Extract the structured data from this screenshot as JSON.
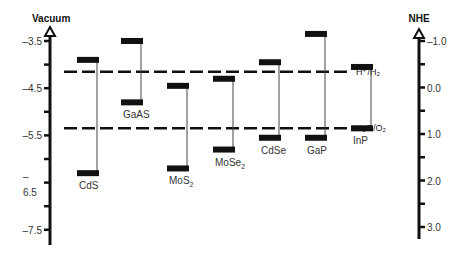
{
  "chart_data": {
    "type": "diagram-bar",
    "title": "",
    "left_axis": {
      "label": "Vacuum",
      "ticks": [
        -3.5,
        -4.5,
        -5.5,
        -6.5,
        -7.5
      ],
      "tick_labels": [
        "-3.5",
        "-4.5",
        "-5.5",
        "6.5",
        "-7.5"
      ],
      "range": [
        -3.5,
        -7.5
      ],
      "unit": "eV"
    },
    "right_axis": {
      "label": "NHE",
      "ticks": [
        -1.0,
        0.0,
        1.0,
        2.0,
        3.0
      ],
      "tick_labels": [
        "-1.0",
        "0.0",
        "1.0",
        "2.0",
        "3.0"
      ],
      "range": [
        -1.0,
        3.0
      ],
      "unit": "V"
    },
    "materials": [
      {
        "name": "CdS",
        "label_main": "CdS",
        "label_sub": "",
        "cb": -3.9,
        "vb": -6.3
      },
      {
        "name": "GaAs",
        "label_main": "GaAS",
        "label_sub": "",
        "cb": -3.5,
        "vb": -4.8
      },
      {
        "name": "MoS2",
        "label_main": "MoS",
        "label_sub": "2",
        "cb": -4.45,
        "vb": -6.2
      },
      {
        "name": "MoSe2",
        "label_main": "MoSe",
        "label_sub": "2",
        "cb": -4.3,
        "vb": -5.8
      },
      {
        "name": "CdSe",
        "label_main": "CdSe",
        "label_sub": "",
        "cb": -3.95,
        "vb": -5.55
      },
      {
        "name": "GaP",
        "label_main": "GaP",
        "label_sub": "",
        "cb": -3.35,
        "vb": -5.55
      },
      {
        "name": "InP",
        "label_main": "InP",
        "label_sub": "",
        "cb": -4.05,
        "vb": -5.35
      }
    ],
    "redox_levels": [
      {
        "name": "H+/H2",
        "label": "H⁺/H₂",
        "vacuum_eV": -4.15,
        "nhe_V": 0.0
      },
      {
        "name": "H2O/O2",
        "label": "H₂O/O₂",
        "vacuum_eV": -5.35,
        "nhe_V": 1.23
      }
    ],
    "xlabel": "",
    "ylabel": "Vacuum",
    "y2label": "NHE",
    "grid": false,
    "legend": null
  },
  "colors": {
    "ink": "#111111",
    "label": "#333333",
    "background": "#ffffff"
  }
}
